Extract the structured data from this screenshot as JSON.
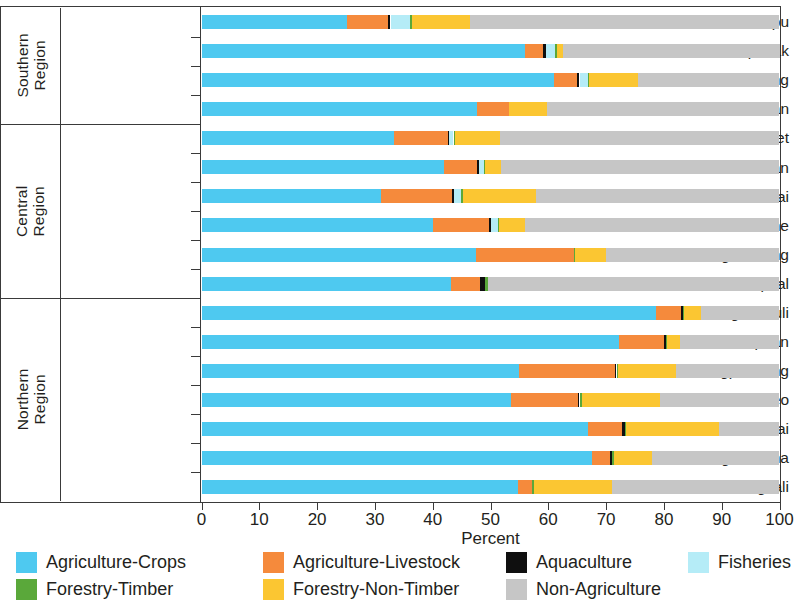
{
  "chart_data": {
    "type": "bar",
    "orientation": "horizontal",
    "stacked": true,
    "title": "",
    "xlabel": "Percent",
    "ylabel": "",
    "xlim": [
      0,
      100
    ],
    "xticks": [
      0,
      10,
      20,
      30,
      40,
      50,
      60,
      70,
      80,
      90,
      100
    ],
    "grid": false,
    "legend_position": "bottom",
    "series": [
      {
        "name": "Agriculture-Crops",
        "color": "#4ec9f0",
        "values": [
          25.2,
          55.9,
          61.0,
          47.7,
          33.3,
          42.0,
          31.0,
          40.0,
          47.5,
          43.1,
          78.7,
          72.3,
          55.0,
          53.6,
          66.8,
          67.6,
          54.8
        ]
      },
      {
        "name": "Agriculture-Livestock",
        "color": "#f58a3c",
        "values": [
          7.0,
          3.2,
          4.0,
          5.5,
          9.3,
          5.6,
          12.4,
          9.8,
          16.9,
          5.0,
          4.3,
          7.8,
          16.5,
          11.5,
          6.0,
          3.1,
          2.4
        ]
      },
      {
        "name": "Aquaculture",
        "color": "#0f0f0f",
        "values": [
          0.5,
          0.5,
          0.4,
          0.0,
          0.3,
          0.4,
          0.3,
          0.3,
          0.0,
          1.0,
          0.3,
          0.3,
          0.3,
          0.3,
          0.5,
          0.3,
          0.0
        ]
      },
      {
        "name": "Fisheries",
        "color": "#b5ecf7",
        "values": [
          3.3,
          1.5,
          1.4,
          0.0,
          0.7,
          0.8,
          1.2,
          1.2,
          0.0,
          0.0,
          0.0,
          0.0,
          0.0,
          0.0,
          0.0,
          0.0,
          0.0
        ]
      },
      {
        "name": "Forestry-Timber",
        "color": "#5aa83a",
        "values": [
          0.4,
          0.4,
          0.3,
          0.0,
          0.2,
          0.2,
          0.3,
          0.2,
          0.3,
          0.4,
          0.2,
          0.2,
          0.3,
          0.4,
          0.2,
          0.3,
          0.4
        ]
      },
      {
        "name": "Forestry-Non-Timber",
        "color": "#fbc632",
        "values": [
          10.0,
          1.0,
          8.4,
          6.6,
          7.9,
          2.9,
          12.7,
          4.4,
          5.3,
          0.0,
          2.9,
          2.2,
          10.0,
          13.5,
          16.0,
          6.7,
          13.5
        ]
      },
      {
        "name": "Non-Agriculture",
        "color": "#c6c6c6",
        "values": [
          53.6,
          37.5,
          24.5,
          40.2,
          48.3,
          48.1,
          42.1,
          44.1,
          30.0,
          50.5,
          13.6,
          17.2,
          17.9,
          20.7,
          10.5,
          22.0,
          28.9
        ]
      }
    ],
    "regions": [
      {
        "name": "Southern Region",
        "categories": [
          "Attapu",
          "Champasak",
          "Xekong",
          "Salavan"
        ]
      },
      {
        "name": "Central Region",
        "categories": [
          "Savannakhet",
          "Khammouan",
          "Bolikhamxai",
          "Vientiane",
          "Xiangkhouang",
          "Vientiane Capital"
        ]
      },
      {
        "name": "Northern Region",
        "categories": [
          "Xaignabouli",
          "Houaphan",
          "Louangphabang",
          "Bokeo",
          "Oudomxai",
          "Louang-Namtha",
          "Phongsali"
        ]
      }
    ],
    "categories": [
      "Attapu",
      "Champasak",
      "Xekong",
      "Salavan",
      "Savannakhet",
      "Khammouan",
      "Bolikhamxai",
      "Vientiane",
      "Xiangkhouang",
      "Vientiane Capital",
      "Xaignabouli",
      "Houaphan",
      "Louangphabang",
      "Bokeo",
      "Oudomxai",
      "Louang-Namtha",
      "Phongsali"
    ]
  },
  "axis": {
    "x_title": "Percent",
    "x_tick_labels": [
      "0",
      "10",
      "20",
      "30",
      "40",
      "50",
      "60",
      "70",
      "80",
      "90",
      "100"
    ]
  },
  "legend": {
    "items": [
      {
        "label": "Agriculture-Crops",
        "color": "#4ec9f0"
      },
      {
        "label": "Agriculture-Livestock",
        "color": "#f58a3c"
      },
      {
        "label": "Aquaculture",
        "color": "#0f0f0f"
      },
      {
        "label": "Fisheries",
        "color": "#b5ecf7"
      },
      {
        "label": "Forestry-Timber",
        "color": "#5aa83a"
      },
      {
        "label": "Forestry-Non-Timber",
        "color": "#fbc632"
      },
      {
        "label": "Non-Agriculture",
        "color": "#c6c6c6"
      }
    ]
  }
}
